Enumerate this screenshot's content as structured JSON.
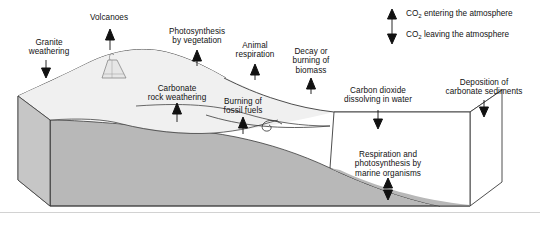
{
  "figure": {
    "background": "#ffffff",
    "colors": {
      "land_fill": "#b8b8b8",
      "surface_fill": "#f2f2f2",
      "ocean_fill": "#ffffff",
      "outline": "#3a3a3a",
      "text": "#121212",
      "arrow": "#111111",
      "rule": "#d2d2d2"
    }
  },
  "legend": {
    "items": [
      {
        "icon": "arrow-up-icon",
        "direction": "up",
        "text_before": "CO",
        "subscript": "2",
        "text_after": " entering the atmosphere",
        "full": "CO2 entering the atmosphere"
      },
      {
        "icon": "arrow-down-icon",
        "direction": "down",
        "text_before": "CO",
        "subscript": "2",
        "text_after": " leaving the atmosphere",
        "full": "CO2 leaving the atmosphere"
      }
    ]
  },
  "flux_labels": [
    {
      "id": "granite-weathering",
      "text": "Granite\nweathering",
      "direction": "down",
      "x": 18,
      "y": 38,
      "w": 62,
      "arrow_x": 46,
      "arrow_y": 62
    },
    {
      "id": "volcanoes",
      "text": "Volcanoes",
      "direction": "up",
      "x": 78,
      "y": 13,
      "w": 62,
      "arrow_x": 109,
      "arrow_y": 28
    },
    {
      "id": "photosynthesis",
      "text": "Photosynthesis\nby vegetation",
      "direction": "up",
      "x": 152,
      "y": 27,
      "w": 90,
      "arrow_x": 197,
      "arrow_y": 52
    },
    {
      "id": "animal-respiration",
      "text": "Animal\nrespiration",
      "direction": "up",
      "x": 222,
      "y": 41,
      "w": 66,
      "arrow_x": 255,
      "arrow_y": 66
    },
    {
      "id": "carbonate-weathering",
      "text": "Carbonate\nrock weathering",
      "direction": "up",
      "x": 130,
      "y": 84,
      "w": 94,
      "arrow_x": 177,
      "arrow_y": 107
    },
    {
      "id": "burning-fossil-fuels",
      "text": "Burning of\nfossil fuels",
      "direction": "up",
      "x": 207,
      "y": 97,
      "w": 72,
      "arrow_x": 243,
      "arrow_y": 120
    },
    {
      "id": "decay-burning-biomass",
      "text": "Decay or\nburning of\nbiomass",
      "direction": "up",
      "x": 280,
      "y": 47,
      "w": 62,
      "arrow_x": 311,
      "arrow_y": 79
    },
    {
      "id": "co2-dissolving",
      "text": "Carbon dioxide\ndissolving in water",
      "direction": "down",
      "x": 330,
      "y": 86,
      "w": 96,
      "arrow_x": 378,
      "arrow_y": 110
    },
    {
      "id": "carbonate-deposition",
      "text": "Deposition of\ncarbonate sediments",
      "direction": "down",
      "x": 432,
      "y": 78,
      "w": 104,
      "arrow_x": 484,
      "arrow_y": 102
    },
    {
      "id": "marine-organisms",
      "text": "Respiration and\nphotosynthesis by\nmarine organisms",
      "direction": "both",
      "x": 336,
      "y": 150,
      "w": 104,
      "arrow_x": 388,
      "arrow_y": 184
    }
  ],
  "scene": {
    "block": {
      "description": "three-dimensional cut-away block of land and ocean",
      "front_face": true,
      "right_face": true,
      "top_surface": true
    },
    "features": [
      {
        "id": "volcano-cone",
        "name": "volcano-icon",
        "x": 112,
        "y": 62
      },
      {
        "id": "river-estuary",
        "name": "river-curl-icon",
        "x": 272,
        "y": 124
      },
      {
        "id": "ocean-basin",
        "name": "ocean-surface",
        "x": 330,
        "y": 118
      }
    ]
  },
  "bottom_rule": {
    "y": 212
  }
}
